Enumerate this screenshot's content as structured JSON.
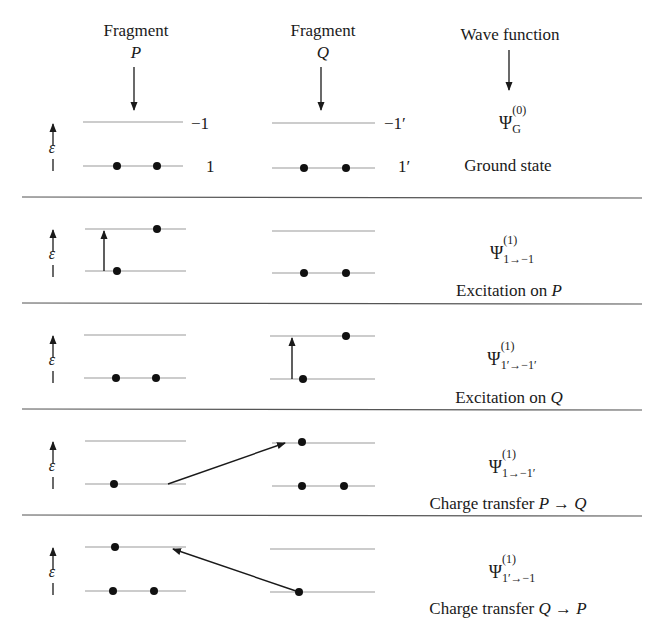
{
  "header": {
    "fragment_p_label": "Fragment",
    "fragment_p_symbol": "P",
    "fragment_q_label": "Fragment",
    "fragment_q_symbol": "Q",
    "wave_function_label": "Wave function"
  },
  "levels": {
    "p_upper": "−1",
    "p_lower": "1",
    "q_upper": "−1′",
    "q_lower": "1′"
  },
  "axis_symbol": "ε",
  "panels": [
    {
      "psi": "Ψ",
      "superscript": "(0)",
      "subscript": "G",
      "caption": "Ground state",
      "caption_italic": ""
    },
    {
      "psi": "Ψ",
      "superscript": "(1)",
      "subscript": "1→−1",
      "caption": "Excitation on ",
      "caption_italic": "P"
    },
    {
      "psi": "Ψ",
      "superscript": "(1)",
      "subscript": "1′→−1′",
      "caption": "Excitation on ",
      "caption_italic": "Q"
    },
    {
      "psi": "Ψ",
      "superscript": "(1)",
      "subscript": "1→−1′",
      "caption": "Charge transfer ",
      "caption_italic": "P → Q"
    },
    {
      "psi": "Ψ",
      "superscript": "(1)",
      "subscript": "1′→−1",
      "caption": "Charge transfer ",
      "caption_italic": "Q → P"
    }
  ],
  "colors": {
    "ink": "#1a1a1a",
    "level_line": "#9a9a9a",
    "divider": "#555555"
  }
}
